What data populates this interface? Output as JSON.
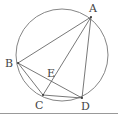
{
  "diagram": {
    "type": "circle-with-inscribed-quadrilateral",
    "circle": {
      "cx": 62,
      "cy": 55,
      "r": 46
    },
    "points": {
      "A": {
        "label": "A",
        "x": 91,
        "y": 17
      },
      "B": {
        "label": "B",
        "x": 18,
        "y": 63
      },
      "C": {
        "label": "C",
        "x": 43,
        "y": 95
      },
      "D": {
        "label": "D",
        "x": 82,
        "y": 98
      },
      "E": {
        "label": "E",
        "x": 50,
        "y": 81
      }
    },
    "segments": [
      [
        "A",
        "B"
      ],
      [
        "A",
        "C"
      ],
      [
        "A",
        "D"
      ],
      [
        "B",
        "C"
      ],
      [
        "B",
        "D"
      ],
      [
        "C",
        "D"
      ]
    ],
    "colors": {
      "line": "#555555",
      "circle": "#777777",
      "rule": "#999999"
    }
  }
}
